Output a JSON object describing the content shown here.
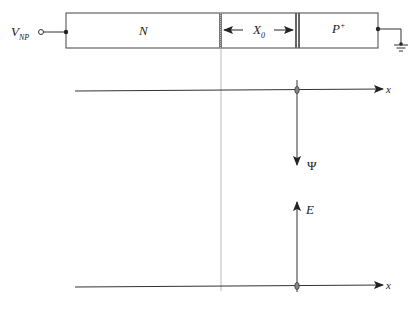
{
  "diagram": {
    "source": {
      "label_main": "V",
      "label_sub": "NP"
    },
    "device": {
      "n_region": {
        "label": "N"
      },
      "depletion": {
        "label_main": "X",
        "label_sub": "0"
      },
      "p_region": {
        "label_main": "P",
        "label_sup": "+"
      }
    },
    "axes": {
      "top_axis": {
        "label": "x"
      },
      "psi_arrow": {
        "label": "Ψ"
      },
      "e_arrow": {
        "label": "E"
      },
      "bottom_axis": {
        "label": "x"
      }
    },
    "colors": {
      "line": "#333333",
      "guide": "#9a9a9a",
      "hatch": "#666666"
    }
  }
}
